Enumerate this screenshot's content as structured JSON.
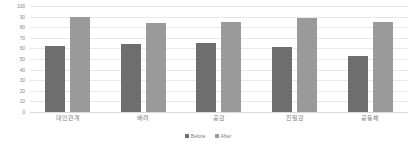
{
  "chart_data": {
    "type": "bar",
    "title": "",
    "subtitle": "",
    "xlabel": "",
    "ylabel": "",
    "ylim": [
      0,
      100
    ],
    "yticks": [
      0,
      10,
      20,
      30,
      40,
      50,
      60,
      70,
      80,
      90,
      100
    ],
    "ytick_labels": [
      "0",
      "10",
      "20",
      "30",
      "40",
      "50",
      "60",
      "70",
      "80",
      "90",
      "100"
    ],
    "grid": true,
    "legend_position": "bottom-center",
    "categories": [
      "대인관계",
      "배려",
      "공감",
      "친밀감",
      "공동체"
    ],
    "series": [
      {
        "name": "Before",
        "color": "#6e6e6e",
        "values": [
          62,
          64,
          65,
          61,
          53
        ]
      },
      {
        "name": "After",
        "color": "#9a9a9a",
        "values": [
          90,
          84,
          85,
          89,
          85
        ]
      }
    ]
  }
}
